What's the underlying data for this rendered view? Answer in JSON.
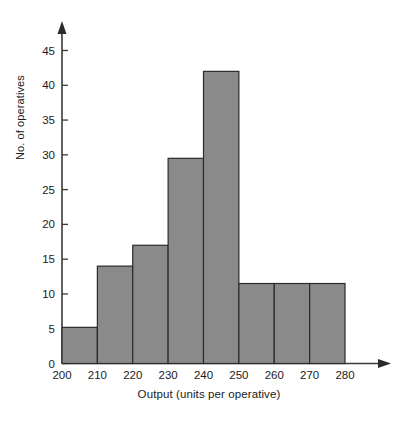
{
  "chart_data": {
    "type": "bar",
    "title": "",
    "subtitle": "",
    "xlabel": "Output (units per operative)",
    "ylabel": "No. of operatives",
    "categories": [
      "200-210",
      "210-220",
      "220-230",
      "230-240",
      "240-250",
      "250-260",
      "260-270",
      "270-280"
    ],
    "bin_edges": [
      200,
      210,
      220,
      230,
      240,
      250,
      260,
      270,
      280
    ],
    "values": [
      5.2,
      14,
      17,
      29.5,
      42,
      11.5,
      11.5,
      11.5
    ],
    "x_tick_labels": [
      "200",
      "210",
      "220",
      "230",
      "240",
      "250",
      "260",
      "270",
      "280"
    ],
    "y_tick_labels": [
      "0",
      "5",
      "10",
      "15",
      "20",
      "25",
      "30",
      "35",
      "40",
      "45"
    ],
    "y_ticks": [
      0,
      5,
      10,
      15,
      20,
      25,
      30,
      35,
      40,
      45
    ],
    "xlim": [
      200,
      280
    ],
    "ylim": [
      0,
      47
    ],
    "grid": false,
    "legend": null,
    "bar_fill_color": "#8a8a8a",
    "bar_stroke_color": "#2b2b2b",
    "axis_color": "#3a3a3a",
    "background_color": "#ffffff"
  }
}
